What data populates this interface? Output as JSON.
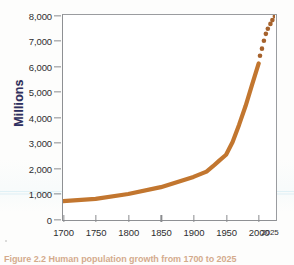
{
  "figure": {
    "caption": "Figure 2.2  Human population growth from 1700 to 2025",
    "axis_color": "#8e9093",
    "line_color": "#c2762f",
    "ytitle_color": "#2b2f63"
  },
  "chart_data": {
    "type": "line",
    "title": "",
    "xlabel": "",
    "ylabel": "Millions",
    "xlim": [
      1700,
      2025
    ],
    "ylim": [
      0,
      8000
    ],
    "grid": false,
    "legend": "none",
    "xticks": [
      "1700",
      "1750",
      "1800",
      "1850",
      "1900",
      "1950",
      "2000"
    ],
    "xtick_values": [
      1700,
      1750,
      1800,
      1850,
      1900,
      1950,
      2000
    ],
    "x_end_label": "2025",
    "yticks": [
      "0",
      "1,000",
      "2,000",
      "3,000",
      "4,000",
      "5,000",
      "6,000",
      "7,000",
      "8,000"
    ],
    "ytick_values": [
      0,
      1000,
      2000,
      3000,
      4000,
      5000,
      6000,
      7000,
      8000
    ],
    "series": [
      {
        "name": "Observed population",
        "style": "solid",
        "x": [
          1700,
          1750,
          1800,
          1850,
          1900,
          1920,
          1930,
          1940,
          1950,
          1960,
          1970,
          1980,
          1990,
          2000
        ],
        "values": [
          700,
          790,
          980,
          1250,
          1650,
          1860,
          2070,
          2300,
          2520,
          3020,
          3700,
          4440,
          5280,
          6100
        ]
      },
      {
        "name": "Projected population",
        "style": "dotted",
        "x": [
          2002,
          2005,
          2008,
          2011,
          2014,
          2018,
          2021,
          2025
        ],
        "values": [
          6400,
          6680,
          6990,
          7260,
          7460,
          7650,
          7800,
          7950
        ]
      }
    ]
  }
}
